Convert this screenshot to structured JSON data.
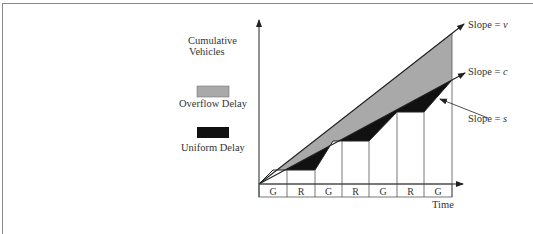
{
  "diagram": {
    "y_axis_label_line1": "Cumulative",
    "y_axis_label_line2": "Vehicles",
    "x_axis_label": "Time",
    "legend": [
      {
        "label": "Overflow Delay",
        "color": "#a9a9a9"
      },
      {
        "label": "Uniform Delay",
        "color": "#111111"
      }
    ],
    "slope_labels": {
      "arrival": {
        "prefix": "Slope = ",
        "var": "v"
      },
      "capacity": {
        "prefix": "Slope = ",
        "var": "c"
      },
      "saturation": {
        "prefix": "Slope = ",
        "var": "s"
      }
    },
    "signal_phases": [
      "G",
      "R",
      "G",
      "R",
      "G",
      "R",
      "G"
    ]
  }
}
